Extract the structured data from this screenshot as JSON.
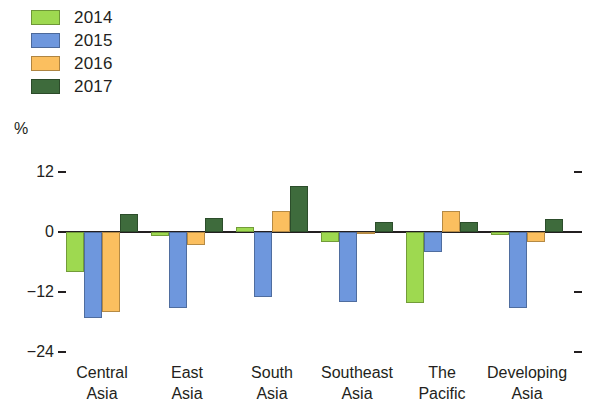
{
  "chart_data": {
    "type": "bar",
    "title": "",
    "subtitle": "",
    "xlabel": "",
    "ylabel": "%",
    "unit_label": "%",
    "ylim": [
      -24,
      12
    ],
    "yticks": [
      12,
      0,
      -12,
      -24
    ],
    "ytick_labels": [
      "12",
      "0",
      "−12",
      "−24"
    ],
    "grid": false,
    "legend_position": "top-left",
    "categories": [
      "Central Asia",
      "East Asia",
      "South Asia",
      "Southeast Asia",
      "The Pacific",
      "Developing Asia"
    ],
    "category_lines": [
      [
        "Central",
        "Asia"
      ],
      [
        "East",
        "Asia"
      ],
      [
        "South",
        "Asia"
      ],
      [
        "Southeast",
        "Asia"
      ],
      [
        "The",
        "Pacific"
      ],
      [
        "Developing",
        "Asia"
      ]
    ],
    "series": [
      {
        "name": "2014",
        "color": "#9ed950",
        "values": [
          -8.0,
          -0.7,
          1.0,
          -2.0,
          -14.2,
          -0.6
        ]
      },
      {
        "name": "2015",
        "color": "#6e97dd",
        "values": [
          -17.2,
          -15.2,
          -13.0,
          -14.0,
          -4.0,
          -15.2
        ]
      },
      {
        "name": "2016",
        "color": "#fbbf5f",
        "values": [
          -16.0,
          -2.6,
          4.2,
          -0.4,
          4.2,
          -2.0
        ]
      },
      {
        "name": "2017",
        "color": "#3e6b3c",
        "values": [
          3.7,
          2.8,
          9.2,
          2.0,
          2.0,
          2.6
        ]
      }
    ]
  },
  "legend": {
    "items": [
      {
        "label": "2014",
        "color": "#9ed950"
      },
      {
        "label": "2015",
        "color": "#6e97dd"
      },
      {
        "label": "2016",
        "color": "#fbbf5f"
      },
      {
        "label": "2017",
        "color": "#3e6b3c"
      }
    ]
  }
}
